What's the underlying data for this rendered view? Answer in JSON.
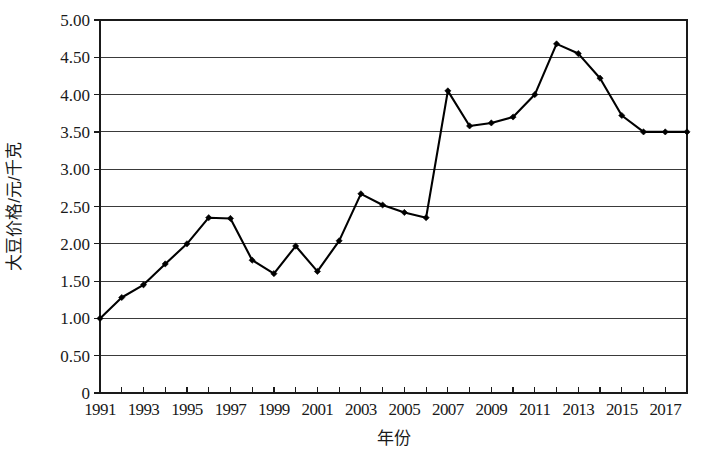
{
  "chart_data": {
    "type": "line",
    "title": "",
    "xlabel": "年份",
    "ylabel": "大豆价格/元/千克",
    "x": [
      1991,
      1992,
      1993,
      1994,
      1995,
      1996,
      1997,
      1998,
      1999,
      2000,
      2001,
      2002,
      2003,
      2004,
      2005,
      2006,
      2007,
      2008,
      2009,
      2010,
      2011,
      2012,
      2013,
      2014,
      2015,
      2016,
      2017,
      2018
    ],
    "values": [
      1.0,
      1.28,
      1.45,
      1.73,
      2.0,
      2.35,
      2.34,
      1.78,
      1.6,
      1.97,
      1.63,
      2.04,
      2.67,
      2.52,
      2.42,
      2.35,
      4.05,
      3.58,
      3.62,
      3.7,
      4.0,
      4.68,
      4.55,
      4.22,
      3.72,
      3.5,
      3.5,
      3.5
    ],
    "series": [
      {
        "name": "大豆价格",
        "values": [
          1.0,
          1.28,
          1.45,
          1.73,
          2.0,
          2.35,
          2.34,
          1.78,
          1.6,
          1.97,
          1.63,
          2.04,
          2.67,
          2.52,
          2.42,
          2.35,
          4.05,
          3.58,
          3.62,
          3.7,
          4.0,
          4.68,
          4.55,
          4.22,
          3.72,
          3.5,
          3.5,
          3.5
        ],
        "color": "#000000"
      }
    ],
    "xlim": [
      1991,
      2018
    ],
    "ylim": [
      0,
      5
    ],
    "y_ticks": [
      0,
      0.5,
      1.0,
      1.5,
      2.0,
      2.5,
      3.0,
      3.5,
      4.0,
      4.5,
      5.0
    ],
    "y_tick_labels": [
      "0",
      "0.50",
      "1.00",
      "1.50",
      "2.00",
      "2.50",
      "3.00",
      "3.50",
      "4.00",
      "4.50",
      "5.00"
    ],
    "x_tick_labels": [
      "1991",
      "1993",
      "1995",
      "1997",
      "1999",
      "2001",
      "2003",
      "2005",
      "2007",
      "2009",
      "2011",
      "2013",
      "2015",
      "2017"
    ],
    "x_tick_values": [
      1991,
      1993,
      1995,
      1997,
      1999,
      2001,
      2003,
      2005,
      2007,
      2009,
      2011,
      2013,
      2015,
      2017
    ],
    "x_minor_ticks": [
      1991,
      1992,
      1993,
      1994,
      1995,
      1996,
      1997,
      1998,
      1999,
      2000,
      2001,
      2002,
      2003,
      2004,
      2005,
      2006,
      2007,
      2008,
      2009,
      2010,
      2011,
      2012,
      2013,
      2014,
      2015,
      2016,
      2017,
      2018
    ],
    "grid": "horizontal",
    "legend": "none",
    "marker": "diamond",
    "line_color": "#000000",
    "grid_color": "#3a3a3a",
    "frame_color": "#1a1a1a",
    "background": "#ffffff"
  },
  "layout": {
    "plot_left": 100,
    "plot_right": 687,
    "plot_top": 20,
    "plot_bottom": 393,
    "width": 709,
    "height": 453
  }
}
